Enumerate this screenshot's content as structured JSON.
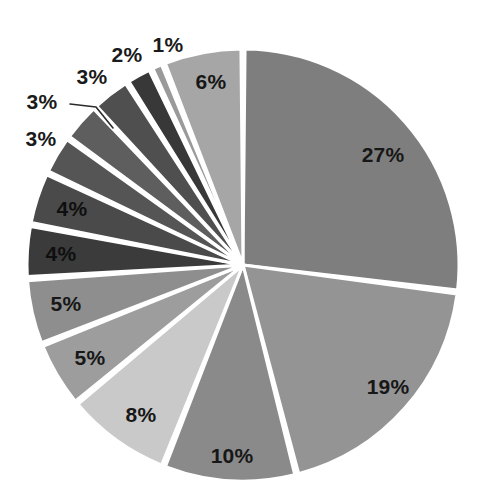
{
  "chart_data": {
    "type": "pie",
    "title": "",
    "subtitle": "",
    "xlabel": "",
    "ylabel": "",
    "legend": "none",
    "grid": false,
    "units": "percent",
    "total": 100,
    "start_angle_deg": 0,
    "direction": "clockwise",
    "categories": [
      "Slice 1",
      "Slice 2",
      "Slice 3",
      "Slice 4",
      "Slice 5",
      "Slice 6",
      "Slice 7",
      "Slice 8",
      "Slice 9",
      "Slice 10",
      "Slice 11",
      "Slice 12",
      "Slice 13",
      "Slice 14"
    ],
    "values": [
      27,
      19,
      10,
      8,
      5,
      5,
      4,
      4,
      3,
      3,
      3,
      2,
      1,
      6
    ],
    "labels": [
      "27%",
      "19%",
      "10%",
      "8%",
      "5%",
      "5%",
      "4%",
      "4%",
      "3%",
      "3%",
      "3%",
      "2%",
      "1%",
      "6%"
    ],
    "colors": [
      "#7e7e7e",
      "#949494",
      "#8a8a8a",
      "#c9c9c9",
      "#9d9d9d",
      "#8e8e8e",
      "#3b3b3b",
      "#4a4a4a",
      "#555555",
      "#5e5e5e",
      "#4f4f4f",
      "#383838",
      "#9a9a9a",
      "#a6a6a6"
    ],
    "slices": [
      {
        "label": "27%",
        "value": 27,
        "color": "#7e7e7e",
        "label_placement": "inside"
      },
      {
        "label": "19%",
        "value": 19,
        "color": "#949494",
        "label_placement": "inside"
      },
      {
        "label": "10%",
        "value": 10,
        "color": "#8a8a8a",
        "label_placement": "inside"
      },
      {
        "label": "8%",
        "value": 8,
        "color": "#c9c9c9",
        "label_placement": "inside"
      },
      {
        "label": "5%",
        "value": 5,
        "color": "#9d9d9d",
        "label_placement": "inside"
      },
      {
        "label": "5%",
        "value": 5,
        "color": "#8e8e8e",
        "label_placement": "inside"
      },
      {
        "label": "4%",
        "value": 4,
        "color": "#3b3b3b",
        "label_placement": "inside"
      },
      {
        "label": "4%",
        "value": 4,
        "color": "#4a4a4a",
        "label_placement": "inside"
      },
      {
        "label": "3%",
        "value": 3,
        "color": "#555555",
        "label_placement": "outside"
      },
      {
        "label": "3%",
        "value": 3,
        "color": "#5e5e5e",
        "label_placement": "outside-leader"
      },
      {
        "label": "3%",
        "value": 3,
        "color": "#4f4f4f",
        "label_placement": "outside"
      },
      {
        "label": "2%",
        "value": 2,
        "color": "#383838",
        "label_placement": "outside"
      },
      {
        "label": "1%",
        "value": 1,
        "color": "#9a9a9a",
        "label_placement": "outside"
      },
      {
        "label": "6%",
        "value": 6,
        "color": "#a6a6a6",
        "label_placement": "inside"
      }
    ]
  },
  "geometry": {
    "center_x": 243,
    "center_y": 265,
    "radius": 216,
    "gap_degrees": 1.1,
    "separator_color": "#ffffff"
  },
  "label_positions": [
    {
      "text": "27%",
      "x": 383,
      "y": 154,
      "size": 21,
      "style": "inside"
    },
    {
      "text": "19%",
      "x": 388,
      "y": 386,
      "size": 21,
      "style": "inside"
    },
    {
      "text": "10%",
      "x": 232,
      "y": 455,
      "size": 21,
      "style": "inside"
    },
    {
      "text": "8%",
      "x": 141,
      "y": 414,
      "size": 21,
      "style": "inside"
    },
    {
      "text": "5%",
      "x": 90,
      "y": 357,
      "size": 21,
      "style": "inside"
    },
    {
      "text": "5%",
      "x": 66,
      "y": 303,
      "size": 21,
      "style": "inside"
    },
    {
      "text": "4%",
      "x": 61,
      "y": 253,
      "size": 21,
      "style": "inside-dark"
    },
    {
      "text": "4%",
      "x": 72,
      "y": 208,
      "size": 21,
      "style": "inside-dark"
    },
    {
      "text": "3%",
      "x": 41,
      "y": 138,
      "size": 21,
      "style": "outside"
    },
    {
      "text": "3%",
      "x": 42,
      "y": 101,
      "size": 21,
      "style": "outside"
    },
    {
      "text": "3%",
      "x": 92,
      "y": 76,
      "size": 21,
      "style": "outside"
    },
    {
      "text": "2%",
      "x": 127,
      "y": 54,
      "size": 21,
      "style": "outside"
    },
    {
      "text": "1%",
      "x": 168,
      "y": 44,
      "size": 21,
      "style": "outside"
    },
    {
      "text": "6%",
      "x": 211,
      "y": 81,
      "size": 21,
      "style": "inside"
    }
  ],
  "leader_lines": [
    {
      "points": "70,104 96,107 113,128"
    }
  ]
}
